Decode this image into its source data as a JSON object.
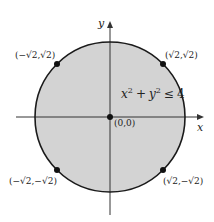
{
  "figure": {
    "type": "closed disk in the plane",
    "colors": {
      "disk_fill": "#d3d3d3",
      "circle_stroke": "#1a1a1a",
      "axis": "#333333",
      "point": "#111111",
      "background": "#ffffff"
    },
    "axes": {
      "x_label": "x",
      "y_label": "y"
    },
    "region": {
      "inequality_lhs_x": "x",
      "inequality_exp_x": "2",
      "inequality_plus": "+",
      "inequality_lhs_y": "y",
      "inequality_exp_y": "2",
      "inequality_rel": "≤",
      "inequality_rhs": "4",
      "inequality_full": "x² + y² ≤ 4",
      "radius": 2,
      "center": [
        0,
        0
      ]
    },
    "points": [
      {
        "id": "origin",
        "label": "(0,0)",
        "x": 0,
        "y": 0
      },
      {
        "id": "upper-left",
        "label": "(−√2,√2)",
        "x": -1.414,
        "y": 1.414
      },
      {
        "id": "upper-right",
        "label": "(√2,√2)",
        "x": 1.414,
        "y": 1.414
      },
      {
        "id": "lower-left",
        "label": "(−√2,−√2)",
        "x": -1.414,
        "y": -1.414
      },
      {
        "id": "lower-right",
        "label": "(√2,−√2)",
        "x": 1.414,
        "y": -1.414
      }
    ]
  }
}
